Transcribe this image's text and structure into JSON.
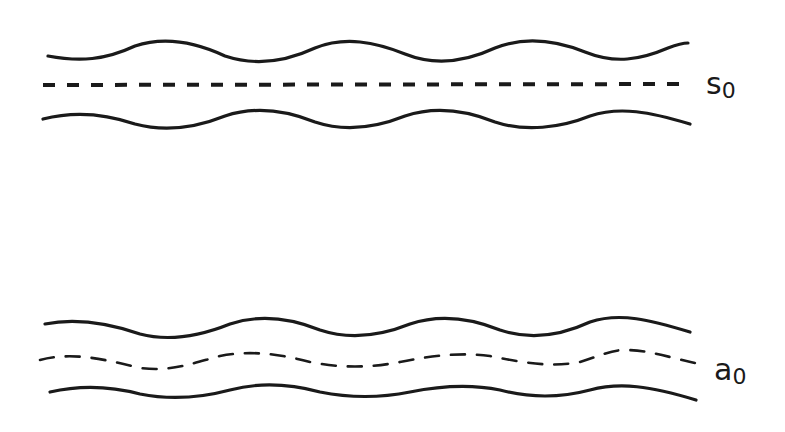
{
  "diagram": {
    "bands": [
      {
        "id": "s",
        "label": "s",
        "subscript": "0",
        "centerline": "straight-dashed",
        "walls": "wavy"
      },
      {
        "id": "a",
        "label": "a",
        "subscript": "0",
        "centerline": "wavy-dashed",
        "walls": "wavy"
      }
    ]
  }
}
